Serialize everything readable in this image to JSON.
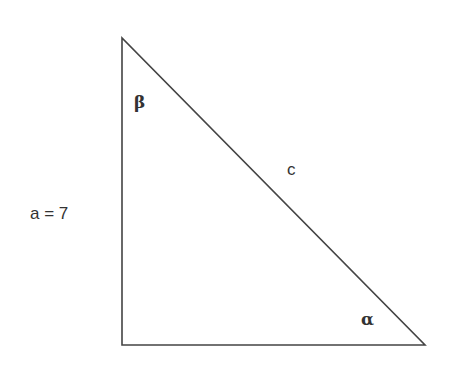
{
  "diagram": {
    "type": "right-triangle",
    "vertices": {
      "top": {
        "x": 122,
        "y": 38
      },
      "bottom_left": {
        "x": 122,
        "y": 345
      },
      "bottom_right": {
        "x": 425,
        "y": 345
      }
    },
    "stroke_color": "#444444",
    "labels": {
      "side_a": "a = 7",
      "hypotenuse": "c",
      "angle_top": "β",
      "angle_bottom_right": "α"
    }
  }
}
